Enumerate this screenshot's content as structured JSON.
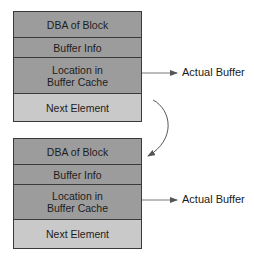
{
  "diagram": {
    "type": "linked-list-buffer-hash-chain",
    "elements": [
      {
        "fields": [
          {
            "label": "DBA of Block"
          },
          {
            "label": "Buffer Info"
          },
          {
            "label": "Location in\nBuffer Cache"
          },
          {
            "label": "Next Element"
          }
        ],
        "pointer_label": "Actual Buffer"
      },
      {
        "fields": [
          {
            "label": "DBA of Block"
          },
          {
            "label": "Buffer Info"
          },
          {
            "label": "Location in\nBuffer Cache"
          },
          {
            "label": "Next Element"
          }
        ],
        "pointer_label": "Actual Buffer"
      }
    ],
    "colors": {
      "field_fill": "#9c9c9c",
      "next_field_fill": "#c9c9c9",
      "border": "#3a3a3a",
      "arrow": "#555555"
    }
  }
}
